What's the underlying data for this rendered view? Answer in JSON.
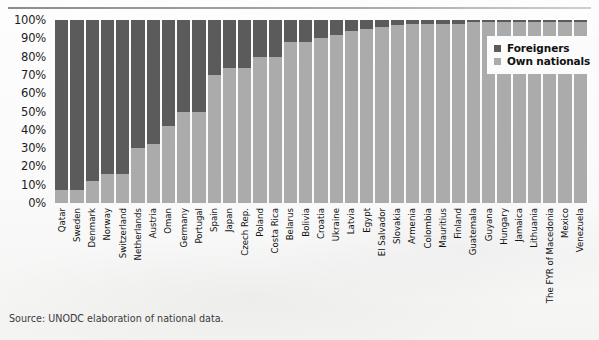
{
  "figure": {
    "source_note": "Source: UNODC elaboration of national data.",
    "colors": {
      "foreigners": "#5b5b5b",
      "own_nationals": "#ababab",
      "background": "#fafafa",
      "axis_text": "#1c1c1c"
    }
  },
  "legend": {
    "position": "top-right",
    "entries": [
      {
        "label": "Foreigners",
        "color": "#5b5b5b",
        "swatch": "square-swatch"
      },
      {
        "label": "Own nationals",
        "color": "#ababab",
        "swatch": "square-swatch"
      }
    ]
  },
  "chart_data": {
    "type": "bar",
    "subtype": "stacked-100-percent",
    "title": "",
    "xlabel": "",
    "ylabel": "",
    "ylim": [
      0,
      100
    ],
    "grid": false,
    "legend_position": "top-right",
    "ytick_labels": [
      "100%",
      "90%",
      "80%",
      "70%",
      "60%",
      "50%",
      "40%",
      "30%",
      "20%",
      "10%",
      "0%"
    ],
    "ytick_values": [
      100,
      90,
      80,
      70,
      60,
      50,
      40,
      30,
      20,
      10,
      0
    ],
    "categories": [
      "Qatar",
      "Sweden",
      "Denmark",
      "Norway",
      "Switzerland",
      "Netherlands",
      "Austria",
      "Oman",
      "Germany",
      "Portugal",
      "Spain",
      "Japan",
      "Czech Rep.",
      "Poland",
      "Costa Rica",
      "Belarus",
      "Bolivia",
      "Croatia",
      "Ukraine",
      "Latvia",
      "Egypt",
      "El Salvador",
      "Slovakia",
      "Armenia",
      "Colombia",
      "Mauritius",
      "Finland",
      "Guatemala",
      "Guyana",
      "Hungary",
      "Jamaica",
      "Lithuania",
      "The FYR of Macedonia",
      "Mexico",
      "Venezuela"
    ],
    "series": [
      {
        "name": "Foreigners",
        "color": "#5b5b5b",
        "values": [
          93,
          93,
          88,
          84,
          84,
          70,
          68,
          58,
          50,
          50,
          30,
          26,
          26,
          20,
          20,
          12,
          12,
          10,
          8,
          6,
          5,
          4,
          3,
          2,
          2,
          2,
          2,
          1,
          1,
          1,
          1,
          1,
          1,
          1,
          1
        ]
      },
      {
        "name": "Own nationals",
        "color": "#ababab",
        "values": [
          7,
          7,
          12,
          16,
          16,
          30,
          32,
          42,
          50,
          50,
          70,
          74,
          74,
          80,
          80,
          88,
          88,
          90,
          92,
          94,
          95,
          96,
          97,
          98,
          98,
          98,
          98,
          99,
          99,
          99,
          99,
          99,
          99,
          99,
          99
        ]
      }
    ]
  }
}
